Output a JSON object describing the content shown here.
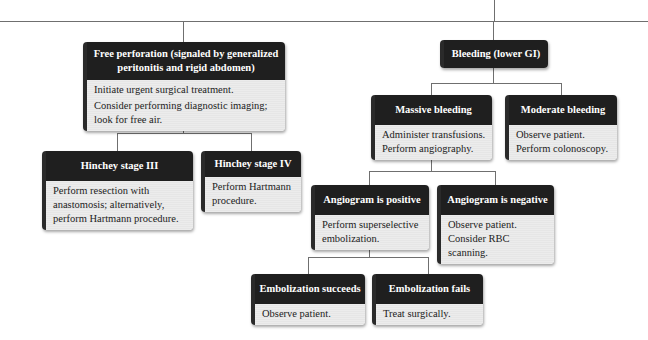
{
  "diagram": {
    "colors": {
      "header_bg": "#1f1f1f",
      "header_text": "#ffffff",
      "body_bg": "#e6e6e6",
      "connector": "#6f6f6f"
    },
    "nodes": {
      "free_perforation": {
        "title": "Free perforation (signaled by generalized peritonitis and rigid abdomen)",
        "lines": [
          "Initiate urgent surgical treatment.",
          "Consider performing diagnostic imaging; look for free air."
        ]
      },
      "hinchey_iii": {
        "title": "Hinchey stage III",
        "lines": [
          "Perform resection with anastomosis; alternatively, perform Hartmann procedure."
        ]
      },
      "hinchey_iv": {
        "title": "Hinchey stage IV",
        "lines": [
          "Perform Hartmann procedure."
        ]
      },
      "bleeding": {
        "title": "Bleeding (lower GI)"
      },
      "massive_bleeding": {
        "title": "Massive bleeding",
        "lines": [
          "Administer transfusions.",
          "Perform angiography."
        ]
      },
      "moderate_bleeding": {
        "title": "Moderate bleeding",
        "lines": [
          "Observe patient.",
          "Perform colonoscopy."
        ]
      },
      "angiogram_positive": {
        "title": "Angiogram is positive",
        "lines": [
          "Perform superselective embolization."
        ]
      },
      "angiogram_negative": {
        "title": "Angiogram is negative",
        "lines": [
          "Observe patient.",
          "Consider RBC scanning."
        ]
      },
      "embolization_succeeds": {
        "title": "Embolization succeeds",
        "lines": [
          "Observe patient."
        ]
      },
      "embolization_fails": {
        "title": "Embolization fails",
        "lines": [
          "Treat surgically."
        ]
      }
    }
  }
}
